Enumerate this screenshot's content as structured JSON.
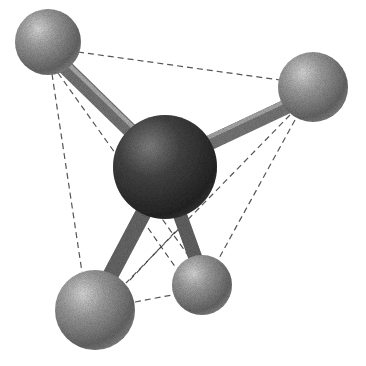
{
  "figure": {
    "central_atom": {
      "cx": 165,
      "cy": 167,
      "r": 52,
      "color": "#4a4a4a"
    },
    "outer_atoms": [
      {
        "id": "top-left",
        "cx": 48,
        "cy": 42,
        "r": 33,
        "color": "#9a9a9a"
      },
      {
        "id": "top-right",
        "cx": 313,
        "cy": 87,
        "r": 35,
        "color": "#a0a0a0"
      },
      {
        "id": "bottom-left",
        "cx": 95,
        "cy": 310,
        "r": 40,
        "color": "#9a9a9a"
      },
      {
        "id": "bottom-right",
        "cx": 202,
        "cy": 285,
        "r": 30,
        "color": "#9c9c9c"
      }
    ],
    "bond_color": "#7a7a7a",
    "edge_color": "#555555"
  }
}
